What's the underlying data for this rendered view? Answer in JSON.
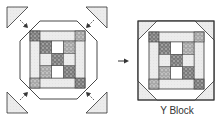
{
  "diagram": {
    "caption": "Y Block",
    "arrow_symbol": "→",
    "colors": {
      "line": "#333333",
      "light_fill": "#ececec",
      "white_fill": "#ffffff",
      "dark_print": "#8a8a8a",
      "medium_print": "#b0b0b0"
    },
    "left_panel": {
      "label": "octagon-center-with-corner-triangles",
      "corner_triangles": 4,
      "arrows": 4
    },
    "right_panel": {
      "label": "finished-y-block"
    }
  }
}
